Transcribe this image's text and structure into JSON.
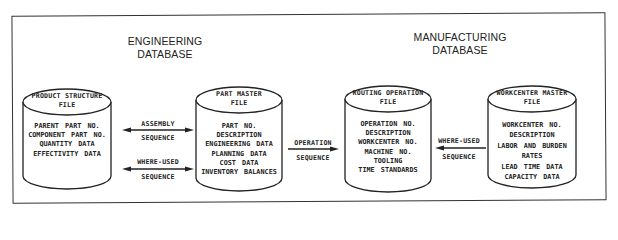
{
  "sections": {
    "engineering": {
      "line1": "ENGINEERING",
      "line2": "DATABASE"
    },
    "manufacturing": {
      "line1": "MANUFACTURING",
      "line2": "DATABASE"
    }
  },
  "files": [
    {
      "id": "product-structure",
      "title": [
        "PRODUCT STRUCTURE",
        "FILE"
      ],
      "fields": [
        "PARENT PART NO.",
        "COMPONENT PART NO.",
        "QUANTITY DATA",
        "EFFECTIVITY DATA"
      ]
    },
    {
      "id": "part-master",
      "title": [
        "PART MASTER",
        "FILE"
      ],
      "fields": [
        "PART NO.",
        "DESCRIPTION",
        "ENGINEERING DATA",
        "PLANNING DATA",
        "COST DATA",
        "INVENTORY BALANCES"
      ]
    },
    {
      "id": "routing-operation",
      "title": [
        "ROUTING OPERATION",
        "FILE"
      ],
      "fields": [
        "OPERATION NO.",
        "DESCRIPTION",
        "WORKCENTER NO.",
        "MACHINE NO.",
        "TOOLING",
        "TIME STANDARDS"
      ]
    },
    {
      "id": "workcenter-master",
      "title": [
        "WORKCENTER MASTER",
        "FILE"
      ],
      "fields": [
        "WORKCENTER NO.",
        "DESCRIPTION",
        "LABOR AND BURDEN",
        "RATES",
        "LEAD TIME DATA",
        "CAPACITY DATA"
      ]
    }
  ],
  "connections": [
    {
      "from": "product-structure",
      "to": "part-master",
      "direction": "both",
      "label_top": "ASSEMBLY",
      "label_bottom": "SEQUENCE"
    },
    {
      "from": "product-structure",
      "to": "part-master",
      "direction": "both",
      "label_top": "WHERE-USED",
      "label_bottom": "SEQUENCE"
    },
    {
      "from": "part-master",
      "to": "routing-operation",
      "direction": "right",
      "label_top": "OPERATION",
      "label_bottom": "SEQUENCE"
    },
    {
      "from": "workcenter-master",
      "to": "routing-operation",
      "direction": "left",
      "label_top": "WHERE-USED",
      "label_bottom": "SEQUENCE"
    }
  ],
  "colors": {
    "line": "#222222",
    "background": "#ffffff"
  }
}
